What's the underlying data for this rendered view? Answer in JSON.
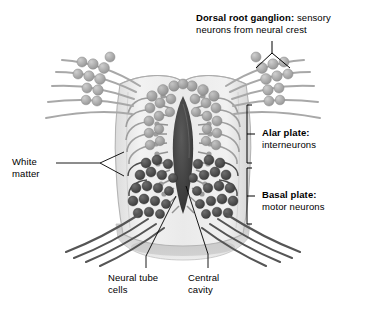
{
  "figure": {
    "background_color": "#ffffff",
    "palette": {
      "tube_wall": "#e9e9e9",
      "tube_wall_edge": "#b9b9b9",
      "alar_neuron": "#9a9a9a",
      "basal_neuron": "#4a4a4a",
      "cavity": "#3a3a3a",
      "sensory_fiber": "#a6a6a6",
      "motor_fiber": "#555555",
      "leader_line": "#000000"
    }
  },
  "labels": {
    "dorsal_root_ganglion": {
      "term": "Dorsal root ganglion:",
      "description": " sensory",
      "line2": "neurons from neural crest",
      "pointer": "v-pointer-to-right-ganglion"
    },
    "alar_plate": {
      "term": "Alar plate:",
      "description": "interneurons",
      "bracket": "right-bracket"
    },
    "basal_plate": {
      "term": "Basal plate:",
      "description": "motor neurons",
      "bracket": "right-bracket"
    },
    "white_matter": {
      "line1": "White",
      "line2": "matter",
      "pointer": "forked-leader-line"
    },
    "neural_tube_cells": {
      "line1": "Neural tube",
      "line2": "cells",
      "pointer": "leader-line"
    },
    "central_cavity": {
      "line1": "Central",
      "line2": "cavity",
      "pointer": "leader-line"
    }
  },
  "anatomy": {
    "regions": [
      {
        "name": "white matter",
        "note": "pale outer mantle of tube wall"
      },
      {
        "name": "alar plate",
        "note": "dorsal half, light gray interneurons"
      },
      {
        "name": "basal plate",
        "note": "ventral half, dark motor neurons"
      },
      {
        "name": "central cavity",
        "note": "dark slit-like lumen"
      },
      {
        "name": "dorsal root ganglion",
        "note": "neural-crest sensory cell clusters, bilateral"
      }
    ]
  }
}
